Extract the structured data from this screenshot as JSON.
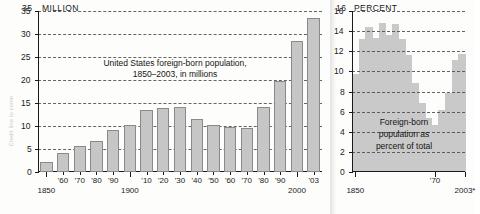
{
  "credit": {
    "text": "Credit line to come"
  },
  "colors": {
    "bar_fill": "#c6c6c6",
    "bar_stroke": "#8a8a8a",
    "area_fill": "#c9c9c9",
    "axis": "#1a1a1a",
    "grid": "#4a4a4a",
    "background": "#fdfdfc"
  },
  "left_panel": {
    "unit_label": "MILLION",
    "unit_value": "35",
    "title_line1": "United States foreign-born population,",
    "title_line2": "1850–2003, in millions",
    "y_ticks": [
      "0",
      "5",
      "10",
      "15",
      "20",
      "25",
      "30",
      "35"
    ],
    "x_tick_labels": [
      "1850",
      "'60",
      "'70",
      "'80",
      "'90",
      "1900",
      "'10",
      "'20",
      "'30",
      "'40",
      "'50",
      "'60",
      "'70",
      "'80",
      "'90",
      "2000",
      "'03"
    ]
  },
  "right_panel": {
    "unit_label": "PERCENT",
    "unit_value": "16",
    "caption_line1": "Foreign-born",
    "caption_line2": "population as",
    "caption_line3": "percent of total",
    "y_ticks": [
      "0",
      "2",
      "4",
      "6",
      "8",
      "10",
      "12",
      "14",
      "16"
    ],
    "x_tick_labels": [
      "1850",
      "'70",
      "2003*"
    ]
  },
  "chart_data": [
    {
      "type": "bar",
      "title": "United States foreign-born population, 1850–2003, in millions",
      "xlabel": "",
      "ylabel": "MILLION",
      "ylim": [
        0,
        35
      ],
      "ytick_step": 5,
      "grid": true,
      "legend": "none",
      "categories": [
        "1850",
        "1860",
        "1870",
        "1880",
        "1890",
        "1900",
        "1910",
        "1920",
        "1930",
        "1940",
        "1950",
        "1960",
        "1970",
        "1980",
        "1990",
        "2000",
        "2003"
      ],
      "category_labels": [
        "1850",
        "'60",
        "'70",
        "'80",
        "'90",
        "1900",
        "'10",
        "'20",
        "'30",
        "'40",
        "'50",
        "'60",
        "'70",
        "'80",
        "'90",
        "2000",
        "'03"
      ],
      "values": [
        2.2,
        4.1,
        5.6,
        6.7,
        9.2,
        10.3,
        13.5,
        13.9,
        14.2,
        11.6,
        10.3,
        9.7,
        9.6,
        14.1,
        19.8,
        28.4,
        33.5
      ]
    },
    {
      "type": "area",
      "title": "Foreign-born population as percent of total",
      "xlabel": "",
      "ylabel": "PERCENT",
      "ylim": [
        0,
        16
      ],
      "ytick_step": 2,
      "grid": true,
      "legend": "none",
      "step": true,
      "categories": [
        "1850",
        "1860",
        "1870",
        "1880",
        "1890",
        "1900",
        "1910",
        "1920",
        "1930",
        "1940",
        "1950",
        "1960",
        "1970",
        "1980",
        "1990",
        "2000",
        "2003"
      ],
      "displayed_x_ticks": [
        "1850",
        "'70",
        "2003*"
      ],
      "values": [
        9.7,
        13.2,
        14.4,
        13.3,
        14.8,
        13.6,
        14.7,
        13.2,
        11.6,
        8.8,
        6.9,
        5.4,
        4.7,
        6.2,
        7.9,
        11.1,
        11.7
      ]
    }
  ]
}
